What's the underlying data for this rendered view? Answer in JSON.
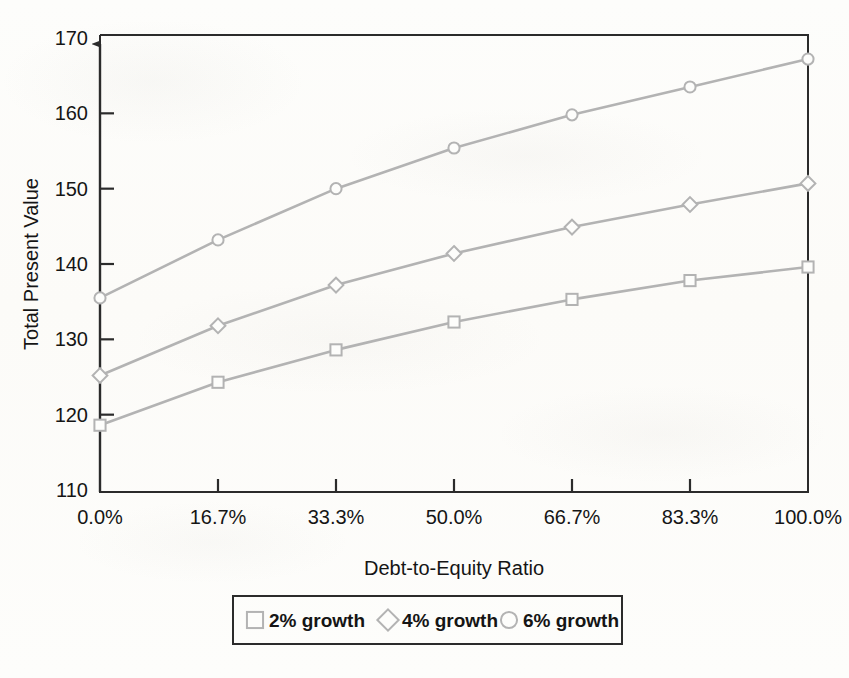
{
  "chart_data": {
    "type": "line",
    "title": "",
    "xlabel": "Debt-to-Equity Ratio",
    "ylabel": "Total Present Value",
    "categories": [
      "0.0%",
      "16.7%",
      "33.3%",
      "50.0%",
      "66.7%",
      "83.3%",
      "100.0%"
    ],
    "x": [
      0.0,
      16.7,
      33.3,
      50.0,
      66.7,
      83.3,
      100.0
    ],
    "ylim": [
      110,
      170
    ],
    "yticks": [
      110,
      120,
      130,
      140,
      150,
      160,
      170
    ],
    "ytick_labels": [
      "110",
      "120",
      "130",
      "140",
      "150",
      "160",
      "170"
    ],
    "grid": false,
    "legend_position": "bottom",
    "series": [
      {
        "name": "2% growth",
        "marker": "square",
        "color": "#b3b3b3",
        "values": [
          118.6,
          124.3,
          128.6,
          132.3,
          135.3,
          137.8,
          139.6
        ]
      },
      {
        "name": "4% growth",
        "marker": "diamond",
        "color": "#b3b3b3",
        "values": [
          125.2,
          131.8,
          137.2,
          141.4,
          144.9,
          147.9,
          150.7
        ]
      },
      {
        "name": "6% growth",
        "marker": "circle",
        "color": "#b3b3b3",
        "values": [
          135.5,
          143.2,
          150.0,
          155.4,
          159.8,
          163.5,
          167.2
        ]
      }
    ]
  },
  "axes": {
    "y_axis_title": "Total Present Value",
    "x_axis_title": "Debt-to-Equity Ratio",
    "frame_color": "#2b2b2b"
  },
  "legend": {
    "items": [
      {
        "label": "2% growth",
        "marker": "square"
      },
      {
        "label": "4% growth",
        "marker": "diamond"
      },
      {
        "label": "6% growth",
        "marker": "circle"
      }
    ],
    "border_color": "#2b2b2b"
  }
}
